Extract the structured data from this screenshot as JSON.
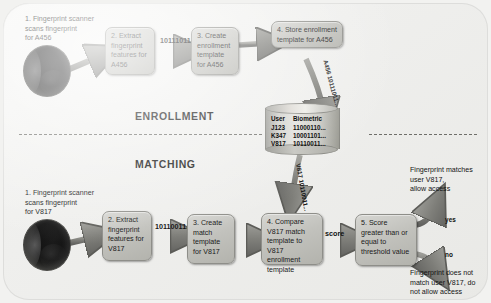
{
  "diagram": {
    "title_enrollment": "ENROLLMENT",
    "title_matching": "MATCHING"
  },
  "enrollment": {
    "step1": "1. Fingerprint scanner\nscans fingerprint\nfor A456",
    "step1_num": "1.",
    "step1_text": "Fingerprint scanner scans fingerprint for A456",
    "step2": "2. Extract\nfingerprint\nfeatures\nfor A456",
    "step3": "3. Create\nenrollment\ntemplate\nfor A456",
    "step4": "4. Store enrollment\ntemplate for A456",
    "arrow_label_features": "10111011...",
    "arrow_label_store": "A456 10111011..."
  },
  "database": {
    "columns": [
      "User",
      "Biometric"
    ],
    "rows": [
      [
        "J123",
        "11000110..."
      ],
      [
        "K347",
        "10001101..."
      ],
      [
        "V817",
        "10110011..."
      ]
    ]
  },
  "matching": {
    "step1": "1. Fingerprint scanner\nscans fingerprint\nfor V817",
    "step2": "2. Extract\nfingerprint\nfeatures\nfor V817",
    "step3": "3. Create\nmatch\ntemplate\nfor V817",
    "step4": "4. Compare V817\nmatch template to\nV817 enrollment\ntemplate",
    "step5": "5. Score\ngreater than\nor equal to\nthreshold value",
    "arrow_label_features": "10110011...",
    "arrow_label_retrieve": "V817 10110011...",
    "arrow_label_score": "score",
    "branch_yes": "yes",
    "branch_no": "no",
    "outcome_yes": "Fingerprint matches\nuser V817,\nallow access",
    "outcome_no": "Fingerprint does not\nmatch user V817, do\nnot allow access"
  },
  "colors": {
    "box_fill": "#c2c2bd",
    "box_border": "#8e8e89",
    "arrow": "#7a7a75",
    "background": "#efefed",
    "text": "#141414"
  }
}
